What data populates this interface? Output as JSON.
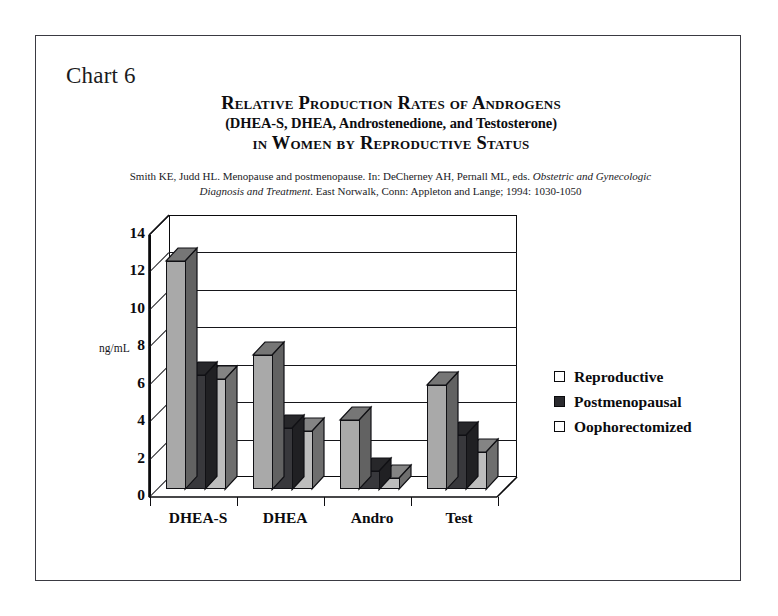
{
  "slide": {
    "chart_label": "Chart 6"
  },
  "title": {
    "line1": "Relative Production Rates of Androgens",
    "line2": "(DHEA-S, DHEA, Androstenedione, and Testosterone)",
    "line3": "in Women by Reproductive Status"
  },
  "citation": {
    "part1": "Smith KE, Judd HL.  Menopause and postmenopause.  In: DeCherney AH, Pernall ML, eds.  ",
    "italic1": "Obstetric and Gynecologic",
    "italic2": "Diagnosis and Treatment",
    "part2": ".  East Norwalk, Conn: Appleton and Lange;  1994: 1030-1050"
  },
  "legend": {
    "items": [
      {
        "label": "Reproductive",
        "color": "#a9a9a9"
      },
      {
        "label": "Postmenopausal",
        "color": "#38383c"
      },
      {
        "label": "Oophorectomized",
        "color": "#bdbdbd"
      }
    ]
  },
  "chart_data": {
    "type": "bar",
    "title": "Relative Production Rates of Androgens (DHEA-S, DHEA, Androstenedione, and Testosterone) in Women by Reproductive Status",
    "xlabel": "",
    "ylabel": "ng/mL",
    "ylim": [
      0,
      14
    ],
    "ytick_step": 2,
    "yticks": [
      "0",
      "2",
      "4",
      "6",
      "8",
      "10",
      "12",
      "14"
    ],
    "grid": true,
    "legend_position": "right",
    "style": "3d-clustered-column",
    "categories": [
      "DHEA-S",
      "DHEA",
      "Andro",
      "Test"
    ],
    "series": [
      {
        "name": "Reproductive",
        "color": "#a9a9a9",
        "values": [
          12.2,
          7.2,
          3.7,
          5.6
        ]
      },
      {
        "name": "Postmenopausal",
        "color": "#38383c",
        "values": [
          6.1,
          3.3,
          1.0,
          2.9
        ]
      },
      {
        "name": "Oophorectomized",
        "color": "#bdbdbd",
        "values": [
          5.9,
          3.1,
          0.6,
          2.0
        ]
      }
    ]
  }
}
